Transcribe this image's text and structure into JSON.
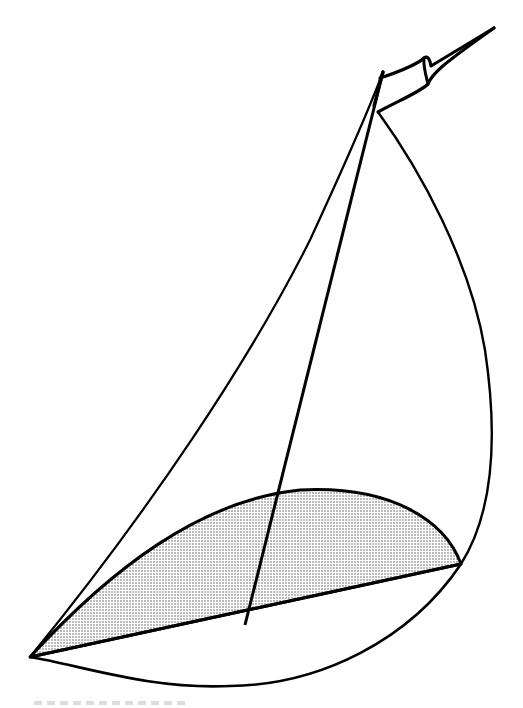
{
  "figure": {
    "stroke_color": "#000000",
    "fill_pattern_color": "#555555",
    "background": "#ffffff",
    "elements": [
      {
        "name": "mast",
        "description": "straight line from masthead to boom"
      },
      {
        "name": "pennant",
        "description": "flag at top of mast"
      },
      {
        "name": "jib-leading-edge",
        "description": "line from masthead to tack"
      },
      {
        "name": "mainsail-leech",
        "description": "curve from masthead to clew"
      },
      {
        "name": "shaded-sail-section",
        "description": "dotted region between boom chord and upper arc"
      },
      {
        "name": "boom-chord",
        "description": "line from tack to clew"
      },
      {
        "name": "hull-curve",
        "description": "lower curve from tack to clew"
      }
    ]
  }
}
